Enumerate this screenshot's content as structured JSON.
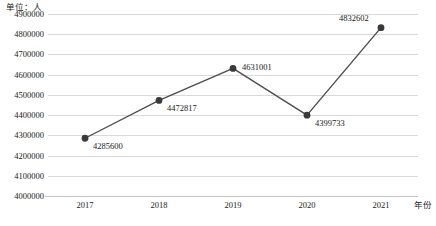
{
  "chart_data": {
    "type": "line",
    "title": "",
    "unit_caption": "单位：人",
    "xlabel": "年份",
    "ylabel": "",
    "categories": [
      "2017",
      "2018",
      "2019",
      "2020",
      "2021"
    ],
    "values": [
      4285600,
      4472817,
      4631001,
      4399733,
      4832602
    ],
    "point_labels": [
      "4285600",
      "4472817",
      "4631001",
      "4399733",
      "4832602"
    ],
    "series": [
      {
        "name": "",
        "values": [
          4285600,
          4472817,
          4631001,
          4399733,
          4832602
        ]
      }
    ],
    "ylim": [
      4000000,
      4900000
    ],
    "ytick_step": 100000,
    "ytick_labels": [
      "4900000",
      "4800000",
      "4700000",
      "4600000",
      "4500000",
      "4400000",
      "4300000",
      "4200000",
      "4100000",
      "4000000"
    ],
    "ytick_values": [
      4900000,
      4800000,
      4700000,
      4600000,
      4500000,
      4400000,
      4300000,
      4200000,
      4100000,
      4000000
    ],
    "grid": {
      "horizontal": true,
      "vertical": false
    },
    "legend": {
      "visible": false,
      "position": "none"
    },
    "colors": {
      "line": "#4d4d4d",
      "marker": "#3a3a3a",
      "gridline": "#d9d9d9",
      "axis": "#c4c4c4",
      "text": "#1a1a1a",
      "background": "#ffffff"
    },
    "marker": {
      "shape": "circle",
      "radius": 3.4
    },
    "label_offsets": [
      {
        "dx": 8,
        "dy": 8
      },
      {
        "dx": 8,
        "dy": 8
      },
      {
        "dx": 9,
        "dy": -1
      },
      {
        "dx": 8,
        "dy": 8
      },
      {
        "dx": -42,
        "dy": -10
      }
    ]
  }
}
